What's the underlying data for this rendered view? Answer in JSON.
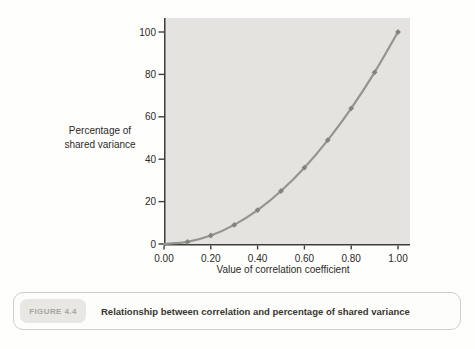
{
  "figure": {
    "label": "FIGURE 4.4",
    "caption": "Relationship between correlation and percentage of shared variance"
  },
  "chart_data": {
    "type": "line",
    "title": "",
    "xlabel": "Value of correlation coefficient",
    "ylabel": "Percentage of\nshared variance",
    "x": [
      0.0,
      0.1,
      0.2,
      0.3,
      0.4,
      0.5,
      0.6,
      0.7,
      0.8,
      0.9,
      1.0
    ],
    "values": [
      0,
      1,
      4,
      9,
      16,
      25,
      36,
      49,
      64,
      81,
      100
    ],
    "x_ticks": [
      "0.00",
      "0.20",
      "0.40",
      "0.60",
      "0.80",
      "1.00"
    ],
    "x_tick_values": [
      0.0,
      0.2,
      0.4,
      0.6,
      0.8,
      1.0
    ],
    "y_ticks": [
      "0",
      "20",
      "40",
      "60",
      "80",
      "100"
    ],
    "y_tick_values": [
      0,
      20,
      40,
      60,
      80,
      100
    ],
    "xlim": [
      0,
      1
    ],
    "ylim": [
      0,
      100
    ],
    "grid": false,
    "legend": null,
    "marker_shape": "diamond",
    "colors": {
      "plot_bg": "#e4e3e0",
      "line": "#95948f",
      "marker": "#84837f",
      "axis": "#3d3c38",
      "tick_text": "#2b2a26"
    }
  }
}
